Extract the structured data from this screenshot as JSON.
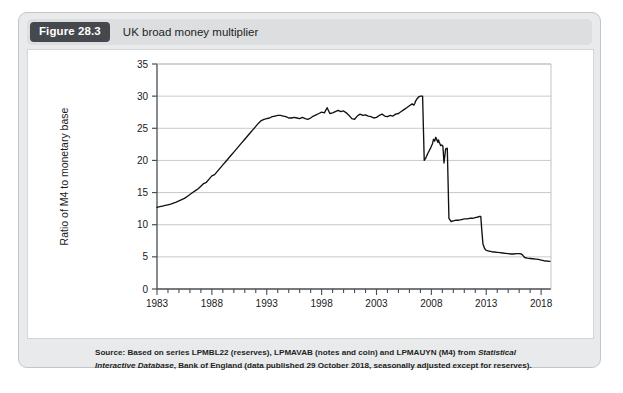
{
  "figure": {
    "number": "Figure 28.3",
    "title": "UK broad money multiplier",
    "source_prefix": "Source: Based on series LPMBL22 (reserves), LPMAVAB (notes and coin) and LPMAUYN (M4) from ",
    "source_italic_1": "Statistical Interactive Database",
    "source_suffix": ", Bank of England (data published 29 October 2018, seasonally adjusted except for reserves)."
  },
  "chart_data": {
    "type": "line",
    "title": "UK broad money multiplier",
    "xlabel": "",
    "ylabel": "Ratio of M4 to monetary base",
    "xlim": [
      1983,
      2018.9
    ],
    "ylim": [
      0,
      35
    ],
    "grid": true,
    "legend": "none",
    "line_color": "#111111",
    "xticks_major": [
      "1983",
      "1988",
      "1993",
      "1998",
      "2003",
      "2008",
      "2013",
      "2018"
    ],
    "xticks_major_values": [
      1983,
      1988,
      1993,
      1998,
      2003,
      2008,
      2013,
      2018
    ],
    "xtick_minor_step": 1,
    "yticks": [
      "0",
      "5",
      "10",
      "15",
      "20",
      "25",
      "30",
      "35"
    ],
    "ytick_values": [
      0,
      5,
      10,
      15,
      20,
      25,
      30,
      35
    ],
    "series": [
      {
        "name": "Ratio of M4 to monetary base",
        "x": [
          1983.0,
          1983.25,
          1983.5,
          1983.75,
          1984.0,
          1984.25,
          1984.5,
          1984.75,
          1985.0,
          1985.25,
          1985.5,
          1985.75,
          1986.0,
          1986.25,
          1986.5,
          1986.75,
          1987.0,
          1987.25,
          1987.5,
          1987.75,
          1988.0,
          1988.25,
          1988.5,
          1988.75,
          1989.0,
          1989.25,
          1989.5,
          1989.75,
          1990.0,
          1990.25,
          1990.5,
          1990.75,
          1991.0,
          1991.25,
          1991.5,
          1991.75,
          1992.0,
          1992.25,
          1992.5,
          1992.75,
          1993.0,
          1993.25,
          1993.5,
          1993.75,
          1994.0,
          1994.25,
          1994.5,
          1994.75,
          1995.0,
          1995.25,
          1995.5,
          1995.75,
          1996.0,
          1996.25,
          1996.5,
          1996.75,
          1997.0,
          1997.25,
          1997.5,
          1997.75,
          1998.0,
          1998.25,
          1998.5,
          1998.75,
          1999.0,
          1999.25,
          1999.5,
          1999.75,
          2000.0,
          2000.25,
          2000.5,
          2000.75,
          2001.0,
          2001.25,
          2001.5,
          2001.75,
          2002.0,
          2002.25,
          2002.5,
          2002.75,
          2003.0,
          2003.25,
          2003.5,
          2003.75,
          2004.0,
          2004.25,
          2004.5,
          2004.75,
          2005.0,
          2005.25,
          2005.5,
          2005.75,
          2006.0,
          2006.25,
          2006.4,
          2006.5,
          2006.55,
          2006.7,
          2006.85,
          2007.0,
          2007.2,
          2007.35,
          2007.5,
          2007.65,
          2007.8,
          2007.95,
          2008.1,
          2008.2,
          2008.3,
          2008.4,
          2008.5,
          2008.6,
          2008.65,
          2008.7,
          2008.78,
          2008.85,
          2008.95,
          2009.05,
          2009.15,
          2009.3,
          2009.45,
          2009.6,
          2009.8,
          2010.0,
          2010.25,
          2010.5,
          2010.75,
          2011.0,
          2011.25,
          2011.5,
          2011.75,
          2012.0,
          2012.25,
          2012.4,
          2012.5,
          2012.6,
          2012.7,
          2012.85,
          2013.0,
          2013.25,
          2013.5,
          2013.75,
          2014.0,
          2014.25,
          2014.5,
          2014.75,
          2015.0,
          2015.25,
          2015.5,
          2015.75,
          2016.0,
          2016.2,
          2016.35,
          2016.5,
          2016.75,
          2017.0,
          2017.25,
          2017.5,
          2017.75,
          2018.0,
          2018.25,
          2018.5,
          2018.8
        ],
        "y": [
          12.7,
          12.8,
          12.9,
          13.0,
          13.1,
          13.2,
          13.35,
          13.5,
          13.7,
          13.9,
          14.1,
          14.4,
          14.7,
          15.0,
          15.3,
          15.6,
          16.0,
          16.4,
          16.6,
          17.1,
          17.6,
          17.8,
          18.3,
          18.8,
          19.3,
          19.8,
          20.3,
          20.8,
          21.3,
          21.8,
          22.3,
          22.8,
          23.3,
          23.8,
          24.3,
          24.8,
          25.3,
          25.8,
          26.2,
          26.4,
          26.5,
          26.6,
          26.8,
          26.9,
          27.0,
          27.0,
          26.9,
          26.8,
          26.6,
          26.6,
          26.7,
          26.6,
          26.5,
          26.7,
          26.5,
          26.4,
          26.6,
          26.9,
          27.1,
          27.3,
          27.5,
          27.4,
          28.2,
          27.3,
          27.4,
          27.6,
          27.8,
          27.6,
          27.7,
          27.4,
          27.0,
          26.5,
          26.4,
          26.9,
          27.2,
          27.0,
          27.1,
          26.9,
          26.8,
          26.6,
          26.7,
          27.0,
          27.2,
          26.9,
          26.8,
          27.0,
          26.9,
          27.2,
          27.3,
          27.6,
          27.9,
          28.2,
          28.5,
          28.8,
          28.6,
          28.9,
          29.2,
          29.6,
          29.9,
          30.0,
          30.0,
          20.0,
          20.4,
          21.0,
          21.5,
          22.0,
          22.6,
          23.3,
          23.0,
          23.6,
          23.2,
          22.8,
          23.2,
          22.9,
          22.6,
          22.3,
          22.4,
          22.2,
          19.6,
          21.8,
          21.9,
          11.0,
          10.5,
          10.6,
          10.7,
          10.7,
          10.8,
          10.9,
          10.9,
          11.0,
          11.0,
          11.1,
          11.2,
          11.3,
          11.3,
          9.0,
          7.0,
          6.3,
          6.0,
          5.9,
          5.8,
          5.75,
          5.7,
          5.65,
          5.6,
          5.55,
          5.5,
          5.45,
          5.45,
          5.5,
          5.5,
          5.45,
          5.2,
          4.9,
          4.8,
          4.75,
          4.7,
          4.65,
          4.6,
          4.5,
          4.4,
          4.35,
          4.3
        ]
      }
    ]
  }
}
